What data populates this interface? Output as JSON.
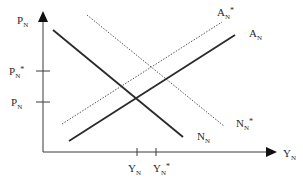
{
  "diagram": {
    "axes": {
      "y_label": "P",
      "y_label_sub": "N",
      "x_label": "Y",
      "x_label_sub": "N"
    },
    "y_ticks": [
      {
        "main": "P",
        "sub": "N",
        "star": "*",
        "y": 71
      },
      {
        "main": "P",
        "sub": "N",
        "star": "",
        "y": 102
      }
    ],
    "x_ticks": [
      {
        "main": "Y",
        "sub": "N",
        "star": "",
        "x": 137
      },
      {
        "main": "Y",
        "sub": "N",
        "star": "*",
        "x": 156
      }
    ],
    "curves": [
      {
        "name": "N_N",
        "label_main": "N",
        "label_sub": "N",
        "label_star": "",
        "style": "solid",
        "x1": 53,
        "y1": 30,
        "x2": 183,
        "y2": 137
      },
      {
        "name": "N_N*",
        "label_main": "N",
        "label_sub": "N",
        "label_star": "*",
        "style": "dotted",
        "x1": 87,
        "y1": 15,
        "x2": 224,
        "y2": 126
      },
      {
        "name": "A_N",
        "label_main": "A",
        "label_sub": "N",
        "label_star": "",
        "style": "solid",
        "x1": 69,
        "y1": 141,
        "x2": 235,
        "y2": 35
      },
      {
        "name": "A_N*",
        "label_main": "A",
        "label_sub": "N",
        "label_star": "*",
        "style": "dotted",
        "x1": 62,
        "y1": 124,
        "x2": 222,
        "y2": 22
      }
    ],
    "colors": {
      "line": "#2a2a2a",
      "axis": "#3a3a3a"
    }
  }
}
